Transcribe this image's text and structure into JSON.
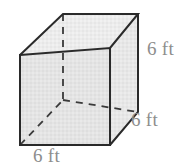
{
  "figure": {
    "name": "cube-diagram",
    "shape": "cube",
    "colors": {
      "edge": "#2a2a2a",
      "hidden_edge": "#3a3a3a",
      "front_face_fill": "#e2e2e2",
      "top_face_fill": "#ebebeb",
      "right_face_fill": "#e6e6e6",
      "label_text": "#8d8d8d",
      "background": "#ffffff"
    },
    "labels": {
      "height": "6 ft",
      "depth": "6 ft",
      "width": "6 ft"
    },
    "geometry": {
      "front_top_left": [
        20,
        55
      ],
      "front_top_right": [
        110,
        48
      ],
      "front_bottom_right": [
        110,
        145
      ],
      "front_bottom_left": [
        20,
        145
      ],
      "back_top_left": [
        63,
        14
      ],
      "back_top_right": [
        138,
        14
      ],
      "back_bottom_right": [
        138,
        112
      ],
      "back_bottom_left": [
        63,
        100
      ]
    }
  }
}
